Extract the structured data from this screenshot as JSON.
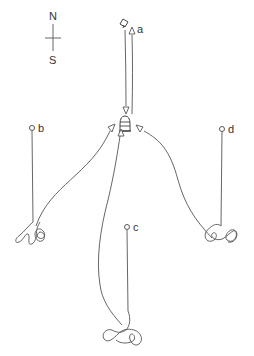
{
  "compass": {
    "north_label": "N",
    "south_label": "S"
  },
  "sites": [
    {
      "id": "a",
      "label": "a"
    },
    {
      "id": "b",
      "label": "b"
    },
    {
      "id": "c",
      "label": "c"
    },
    {
      "id": "d",
      "label": "d"
    }
  ],
  "colors": {
    "stroke": "#555555",
    "text": "#333333",
    "background": "#ffffff"
  }
}
